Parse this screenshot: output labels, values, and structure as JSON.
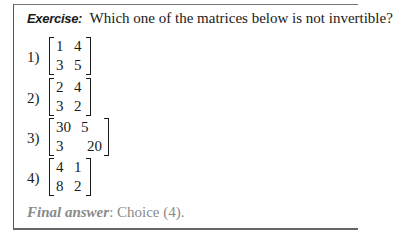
{
  "exercise": {
    "label": "Exercise:",
    "question": "Which one of the matrices below is not invertible?"
  },
  "choices": [
    {
      "number": "1)",
      "matrix": [
        [
          "1",
          "4"
        ],
        [
          "3",
          "5"
        ]
      ]
    },
    {
      "number": "2)",
      "matrix": [
        [
          "2",
          "4"
        ],
        [
          "3",
          "2"
        ]
      ]
    },
    {
      "number": "3)",
      "matrix": [
        [
          "30",
          "5"
        ],
        [
          "3",
          "20"
        ]
      ]
    },
    {
      "number": "4)",
      "matrix": [
        [
          "4",
          "1"
        ],
        [
          "8",
          "2"
        ]
      ]
    }
  ],
  "final_answer": {
    "label": "Final answer",
    "text": ": Choice (4)."
  }
}
